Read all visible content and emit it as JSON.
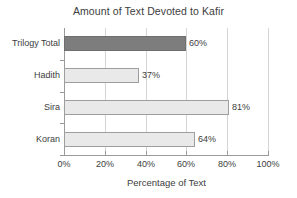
{
  "chart_data": {
    "type": "bar",
    "orientation": "horizontal",
    "title": "Amount of Text Devoted to Kafir",
    "xlabel": "Percentage of Text",
    "ylabel": "",
    "xlim": [
      0,
      100
    ],
    "grid": true,
    "legend": "none",
    "categories": [
      "Trilogy Total",
      "Hadith",
      "Sira",
      "Koran"
    ],
    "values": [
      60,
      37,
      81,
      64
    ],
    "data_labels": [
      "60%",
      "37%",
      "81%",
      "64%"
    ],
    "xtick_labels": [
      "0%",
      "20%",
      "40%",
      "60%",
      "80%",
      "100%"
    ],
    "xtick_values": [
      0,
      20,
      40,
      60,
      80,
      100
    ],
    "bar_colors": [
      "#7d7d7d",
      "#e9e9e9",
      "#e9e9e9",
      "#e9e9e9"
    ],
    "bar_border_color": "#9e9e9e",
    "axis_color": "#9a9a9a",
    "grid_color": "#d4d4d4",
    "background_color": "#ffffff",
    "text_color": "#3d3d3d"
  }
}
